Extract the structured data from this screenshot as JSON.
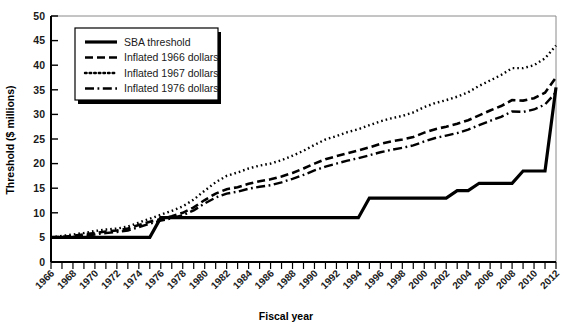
{
  "chart_data": {
    "type": "line",
    "title": "",
    "xlabel": "Fiscal year",
    "ylabel": "Threshold ($ millions)",
    "xlim": [
      1966,
      2012
    ],
    "ylim": [
      0,
      50
    ],
    "yticks": [
      0,
      5,
      10,
      15,
      20,
      25,
      30,
      35,
      40,
      45,
      50
    ],
    "xticks": [
      1966,
      1967,
      1968,
      1969,
      1970,
      1971,
      1972,
      1973,
      1974,
      1975,
      1976,
      1977,
      1978,
      1979,
      1980,
      1981,
      1982,
      1983,
      1984,
      1985,
      1986,
      1987,
      1988,
      1989,
      1990,
      1991,
      1992,
      1993,
      1994,
      1995,
      1996,
      1997,
      1998,
      1999,
      2000,
      2001,
      2002,
      2003,
      2004,
      2005,
      2006,
      2007,
      2008,
      2009,
      2010,
      2011,
      2012
    ],
    "xtick_labels": [
      1966,
      1968,
      1970,
      1972,
      1974,
      1976,
      1978,
      1980,
      1982,
      1984,
      1986,
      1988,
      1990,
      1992,
      1994,
      1996,
      1998,
      2000,
      2002,
      2004,
      2006,
      2008,
      2010,
      2012
    ],
    "grid": false,
    "legend_position": "upper-left",
    "x": [
      1966,
      1967,
      1968,
      1969,
      1970,
      1971,
      1972,
      1973,
      1974,
      1975,
      1976,
      1977,
      1978,
      1979,
      1980,
      1981,
      1982,
      1983,
      1984,
      1985,
      1986,
      1987,
      1988,
      1989,
      1990,
      1991,
      1992,
      1993,
      1994,
      1995,
      1996,
      1997,
      1998,
      1999,
      2000,
      2001,
      2002,
      2003,
      2004,
      2005,
      2006,
      2007,
      2008,
      2009,
      2010,
      2011,
      2012
    ],
    "series": [
      {
        "name": "SBA threshold",
        "style": "solid",
        "width": 3.2,
        "values": [
          5.0,
          5.0,
          5.0,
          5.0,
          5.0,
          5.0,
          5.0,
          5.0,
          5.0,
          5.0,
          9.0,
          9.0,
          9.0,
          9.0,
          9.0,
          9.0,
          9.0,
          9.0,
          9.0,
          9.0,
          9.0,
          9.0,
          9.0,
          9.0,
          9.0,
          9.0,
          9.0,
          9.0,
          9.0,
          13.0,
          13.0,
          13.0,
          13.0,
          13.0,
          13.0,
          13.0,
          13.0,
          14.5,
          14.5,
          16.0,
          16.0,
          16.0,
          16.0,
          18.5,
          18.5,
          18.5,
          35.5
        ]
      },
      {
        "name": "Inflated 1966 dollars",
        "style": "dashed",
        "width": 2.6,
        "values": [
          5.0,
          5.1,
          5.3,
          5.6,
          5.9,
          6.2,
          6.4,
          6.8,
          7.5,
          8.2,
          8.7,
          9.3,
          10.0,
          11.1,
          12.6,
          13.9,
          14.8,
          15.2,
          15.9,
          16.4,
          16.8,
          17.4,
          18.1,
          19.0,
          20.0,
          20.9,
          21.5,
          22.1,
          22.7,
          23.3,
          24.0,
          24.5,
          24.9,
          25.4,
          26.3,
          27.0,
          27.5,
          28.1,
          28.8,
          29.8,
          30.8,
          31.7,
          32.9,
          32.8,
          33.3,
          34.4,
          37.5
        ]
      },
      {
        "name": "Inflated 1967 dollars",
        "style": "dotted",
        "width": 2.4,
        "values": [
          5.0,
          5.3,
          5.6,
          5.9,
          6.3,
          6.6,
          6.8,
          7.2,
          8.0,
          8.8,
          9.6,
          10.4,
          11.3,
          12.7,
          14.5,
          16.2,
          17.5,
          18.2,
          19.0,
          19.6,
          20.0,
          20.7,
          21.6,
          22.6,
          23.8,
          24.9,
          25.6,
          26.4,
          27.0,
          27.8,
          28.6,
          29.2,
          29.7,
          30.4,
          31.5,
          32.3,
          32.9,
          33.6,
          34.5,
          35.8,
          36.9,
          38.0,
          39.4,
          39.4,
          40.0,
          41.4,
          44.0
        ]
      },
      {
        "name": "Inflated 1976 dollars",
        "style": "dashdot",
        "width": 2.4,
        "values": [
          5.0,
          5.0,
          5.1,
          5.3,
          5.6,
          5.9,
          6.1,
          6.4,
          7.1,
          7.8,
          8.4,
          8.9,
          9.5,
          10.5,
          11.9,
          13.1,
          13.9,
          14.3,
          14.9,
          15.3,
          15.6,
          16.2,
          16.9,
          17.7,
          18.6,
          19.4,
          20.0,
          20.6,
          21.1,
          21.7,
          22.3,
          22.8,
          23.2,
          23.7,
          24.5,
          25.2,
          25.7,
          26.2,
          26.9,
          27.8,
          28.7,
          29.5,
          30.6,
          30.5,
          31.0,
          32.0,
          34.5
        ]
      }
    ]
  },
  "legend": {
    "items": [
      {
        "label": "SBA threshold",
        "style": "solid"
      },
      {
        "label": "Inflated 1966 dollars",
        "style": "dashed"
      },
      {
        "label": "Inflated 1967 dollars",
        "style": "dotted"
      },
      {
        "label": "Inflated 1976 dollars",
        "style": "dashdot"
      }
    ]
  }
}
